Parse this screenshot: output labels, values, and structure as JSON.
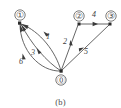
{
  "figure": {
    "caption": "(b)",
    "kind": "directed-multigraph"
  },
  "colors": {
    "edge": "#555555",
    "node_outline": "#5a5a5a",
    "node_fill": "#ffffff",
    "marker": "#2b2b2b",
    "text": "#4a4a4a",
    "background": "#ffffff"
  },
  "graph": {
    "nodes": [
      {
        "id": "1",
        "label": "①",
        "x": 20,
        "y": 15,
        "marker_x": 20,
        "marker_y": 23
      },
      {
        "id": "2",
        "label": "②",
        "x": 79,
        "y": 16,
        "marker_x": 79,
        "marker_y": 24
      },
      {
        "id": "3",
        "label": "③",
        "x": 111,
        "y": 16,
        "marker_x": 110,
        "marker_y": 24
      },
      {
        "id": "0",
        "label": "⓪",
        "x": 61,
        "y": 80,
        "marker_x": 61,
        "marker_y": 72
      }
    ],
    "edges": [
      {
        "id": "e1",
        "from": "0",
        "to": "1",
        "label": "1",
        "label_x": 48,
        "label_y": 36
      },
      {
        "id": "e3",
        "from": "0",
        "to": "1",
        "label": "3",
        "label_x": 33,
        "label_y": 52
      },
      {
        "id": "e6",
        "from": "0",
        "to": "1",
        "label": "6",
        "label_x": 21,
        "label_y": 60
      },
      {
        "id": "e2",
        "from": "0",
        "to": "2",
        "label": "2",
        "label_x": 65,
        "label_y": 41
      },
      {
        "id": "e5",
        "from": "0",
        "to": "3",
        "label": "5",
        "label_x": 85,
        "label_y": 51
      },
      {
        "id": "e4",
        "from": "2",
        "to": "3",
        "label": "4",
        "label_x": 94,
        "label_y": 14
      }
    ]
  }
}
